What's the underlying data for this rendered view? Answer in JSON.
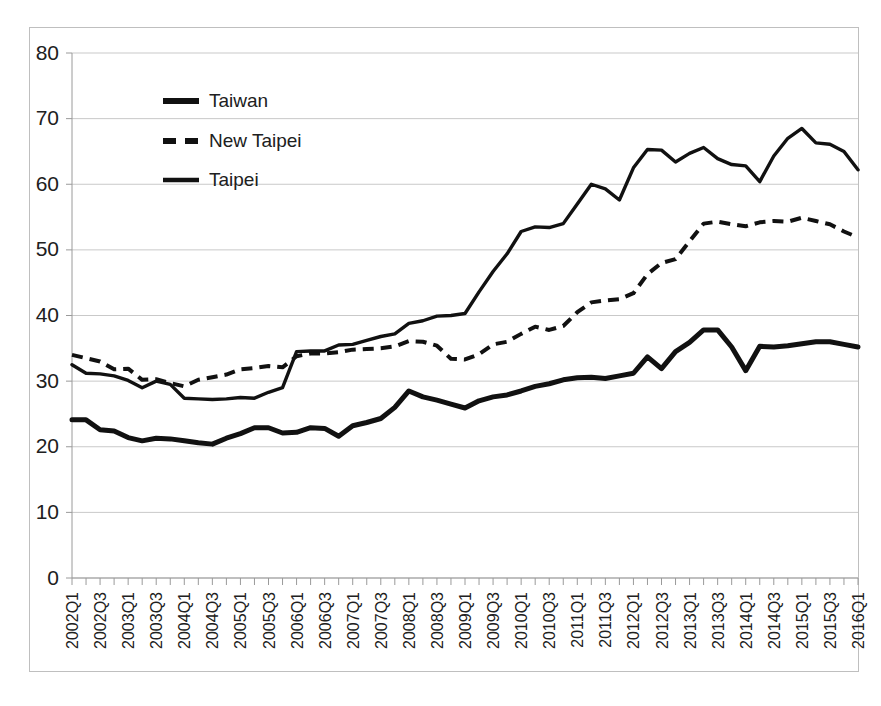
{
  "chart_data": {
    "type": "line",
    "title": "",
    "subtitle": "",
    "xlabel": "",
    "ylabel": "",
    "ylim": [
      0,
      80
    ],
    "ytick_step": 10,
    "ytick_labels": [
      "0",
      "10",
      "20",
      "30",
      "40",
      "50",
      "60",
      "70",
      "80"
    ],
    "grid": true,
    "legend_position": "upper-left-inside",
    "x_label_interval": 2,
    "x": [
      "2002Q1",
      "2002Q2",
      "2002Q3",
      "2002Q4",
      "2003Q1",
      "2003Q2",
      "2003Q3",
      "2003Q4",
      "2004Q1",
      "2004Q2",
      "2004Q3",
      "2004Q4",
      "2005Q1",
      "2005Q2",
      "2005Q3",
      "2005Q4",
      "2006Q1",
      "2006Q2",
      "2006Q3",
      "2006Q4",
      "2007Q1",
      "2007Q2",
      "2007Q3",
      "2007Q4",
      "2008Q1",
      "2008Q2",
      "2008Q3",
      "2008Q4",
      "2009Q1",
      "2009Q2",
      "2009Q3",
      "2009Q4",
      "2010Q1",
      "2010Q2",
      "2010Q3",
      "2010Q4",
      "2011Q1",
      "2011Q2",
      "2011Q3",
      "2011Q4",
      "2012Q1",
      "2012Q2",
      "2012Q3",
      "2012Q4",
      "2013Q1",
      "2013Q2",
      "2013Q3",
      "2013Q4",
      "2014Q1",
      "2014Q2",
      "2014Q3",
      "2014Q4",
      "2015Q1",
      "2015Q2",
      "2015Q3",
      "2015Q4",
      "2016Q1"
    ],
    "x_tick_labels": [
      "2002Q1",
      "2002Q3",
      "2003Q1",
      "2003Q3",
      "2004Q1",
      "2004Q3",
      "2005Q1",
      "2005Q3",
      "2006Q1",
      "2006Q3",
      "2007Q1",
      "2007Q3",
      "2008Q1",
      "2008Q3",
      "2009Q1",
      "2009Q3",
      "2010Q1",
      "2010Q3",
      "2011Q1",
      "2011Q3",
      "2012Q1",
      "2012Q3",
      "2013Q1",
      "2013Q3",
      "2014Q1",
      "2014Q3",
      "2015Q1",
      "2015Q3",
      "2016Q1"
    ],
    "series": [
      {
        "name": "Taiwan",
        "style": "solid-thick",
        "values": [
          24.1,
          24.1,
          22.6,
          22.4,
          21.4,
          20.9,
          21.3,
          21.2,
          20.9,
          20.6,
          20.4,
          21.3,
          22.0,
          22.9,
          22.9,
          22.1,
          22.2,
          22.9,
          22.8,
          21.6,
          23.2,
          23.7,
          24.3,
          26.0,
          28.5,
          27.6,
          27.1,
          26.5,
          25.9,
          27.0,
          27.6,
          27.9,
          28.5,
          29.2,
          29.6,
          30.2,
          30.5,
          30.6,
          30.4,
          30.8,
          31.2,
          33.7,
          31.9,
          34.5,
          35.9,
          37.8,
          37.8,
          35.2,
          31.6,
          35.3,
          35.2,
          35.4,
          35.7,
          36.0,
          36.0,
          35.6,
          35.2
        ]
      },
      {
        "name": "New Taipei",
        "style": "dashed",
        "values": [
          34.0,
          33.5,
          33.0,
          31.8,
          31.9,
          30.2,
          30.3,
          29.7,
          29.2,
          30.2,
          30.6,
          31.0,
          31.8,
          32.0,
          32.3,
          32.1,
          33.8,
          34.2,
          34.2,
          34.4,
          34.8,
          34.9,
          35.0,
          35.3,
          36.1,
          36.0,
          35.4,
          33.4,
          33.3,
          34.1,
          35.6,
          36.0,
          37.2,
          38.3,
          37.8,
          38.4,
          40.5,
          42.0,
          42.3,
          42.5,
          43.4,
          46.3,
          48.0,
          48.6,
          51.3,
          54.0,
          54.3,
          53.9,
          53.6,
          54.2,
          54.4,
          54.3,
          54.9,
          54.4,
          53.9,
          52.8,
          51.9
        ]
      },
      {
        "name": "Taipei",
        "style": "solid-thin",
        "values": [
          32.5,
          31.2,
          31.1,
          30.8,
          30.1,
          29.0,
          30.0,
          29.5,
          27.4,
          27.3,
          27.2,
          27.3,
          27.5,
          27.4,
          28.3,
          29.0,
          34.5,
          34.6,
          34.6,
          35.5,
          35.6,
          36.2,
          36.8,
          37.2,
          38.8,
          39.2,
          39.9,
          40.0,
          40.3,
          43.6,
          46.7,
          49.4,
          52.8,
          53.5,
          53.4,
          54.0,
          57.0,
          60.0,
          59.3,
          57.6,
          62.5,
          65.3,
          65.2,
          63.4,
          64.7,
          65.6,
          63.9,
          63.0,
          62.8,
          60.4,
          64.3,
          67.0,
          68.5,
          66.3,
          66.1,
          65.0,
          62.2
        ]
      }
    ],
    "legend": [
      {
        "label": "Taiwan",
        "style": "solid-thick"
      },
      {
        "label": "New Taipei",
        "style": "dashed"
      },
      {
        "label": "Taipei",
        "style": "solid-thin"
      }
    ],
    "colors": {
      "series_line": "#111111",
      "gridline": "#c9c9c9",
      "axis": "#9a9a9a",
      "frame": "#bfbfbf",
      "background": "#ffffff",
      "text": "#202020"
    }
  }
}
